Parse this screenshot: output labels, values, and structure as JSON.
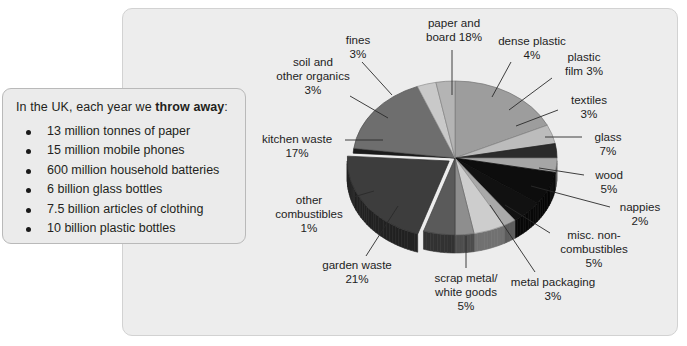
{
  "callout": {
    "heading_prefix": "In the UK, each year we ",
    "heading_bold": "throw away",
    "heading_suffix": ":",
    "items": [
      "13 million tonnes of paper",
      "15 million mobile phones",
      "600 million household batteries",
      "6 billion glass bottles",
      "7.5 billion articles of clothing",
      "10 billion plastic bottles"
    ]
  },
  "chart_data": {
    "type": "pie",
    "title": "",
    "subtitle": "",
    "xlabel": "",
    "ylabel": "",
    "legend_position": "callout-labels",
    "grid": false,
    "units": "percent",
    "total": 100,
    "categories": [
      "paper and board",
      "dense plastic",
      "plastic film",
      "textiles",
      "glass",
      "wood",
      "nappies",
      "misc. non-combustibles",
      "metal packaging",
      "scrap metal/white goods",
      "garden waste",
      "other combustibles",
      "kitchen waste",
      "soil and other organics",
      "fines"
    ],
    "values": [
      18,
      4,
      3,
      3,
      7,
      5,
      2,
      5,
      3,
      5,
      21,
      1,
      17,
      3,
      3
    ],
    "slices": [
      {
        "name": "paper and board",
        "value": 18,
        "label": "paper and\nboard 18%",
        "color": "#9d9d9d"
      },
      {
        "name": "dense plastic",
        "value": 4,
        "label": "dense plastic\n4%",
        "color": "#bcbcbc"
      },
      {
        "name": "plastic film",
        "value": 3,
        "label": "plastic\nfilm 3%",
        "color": "#2b2b2b"
      },
      {
        "name": "textiles",
        "value": 3,
        "label": "textiles\n3%",
        "color": "#a6a6a6"
      },
      {
        "name": "glass",
        "value": 7,
        "label": "glass\n7%",
        "color": "#0d0d0d"
      },
      {
        "name": "wood",
        "value": 5,
        "label": "wood\n5%",
        "color": "#111111"
      },
      {
        "name": "nappies",
        "value": 2,
        "label": "nappies\n2%",
        "color": "#a9a9a9"
      },
      {
        "name": "misc. non-combustibles",
        "value": 5,
        "label": "misc. non-\ncombustibles\n5%",
        "color": "#cdcdcd"
      },
      {
        "name": "metal packaging",
        "value": 3,
        "label": "metal packaging\n3%",
        "color": "#8e8e8e"
      },
      {
        "name": "scrap metal/white goods",
        "value": 5,
        "label": "scrap metal/\nwhite goods\n5%",
        "color": "#5a5a5a"
      },
      {
        "name": "garden waste",
        "value": 21,
        "label": "garden waste\n21%",
        "color": "#3d3d3d"
      },
      {
        "name": "other combustibles",
        "value": 1,
        "label": "other\ncombustibles\n1%",
        "color": "#1b1b1b"
      },
      {
        "name": "kitchen waste",
        "value": 17,
        "label": "kitchen waste\n17%",
        "color": "#6e6e6e"
      },
      {
        "name": "soil and other organics",
        "value": 3,
        "label": "soil and\nother organics\n3%",
        "color": "#c9c9c9"
      },
      {
        "name": "fines",
        "value": 3,
        "label": "fines\n3%",
        "color": "#b4b4b4"
      }
    ]
  },
  "labels": {
    "paper_and_board": {
      "l1": "paper and",
      "l2": "board 18%"
    },
    "fines": {
      "l1": "fines",
      "l2": "3%"
    },
    "dense_plastic": {
      "l1": "dense plastic",
      "l2": "4%"
    },
    "plastic_film": {
      "l1": "plastic",
      "l2": "film 3%"
    },
    "soil_organics": {
      "l1": "soil and",
      "l2": "other organics",
      "l3": "3%"
    },
    "textiles": {
      "l1": "textiles",
      "l2": "3%"
    },
    "glass": {
      "l1": "glass",
      "l2": "7%"
    },
    "kitchen_waste": {
      "l1": "kitchen waste",
      "l2": "17%"
    },
    "wood": {
      "l1": "wood",
      "l2": "5%"
    },
    "nappies": {
      "l1": "nappies",
      "l2": "2%"
    },
    "other_comb": {
      "l1": "other",
      "l2": "combustibles",
      "l3": "1%"
    },
    "misc_noncomb": {
      "l1": "misc. non-",
      "l2": "combustibles",
      "l3": "5%"
    },
    "garden_waste": {
      "l1": "garden waste",
      "l2": "21%"
    },
    "metal_packaging": {
      "l1": "metal packaging",
      "l2": "3%"
    },
    "scrap_metal": {
      "l1": "scrap metal/",
      "l2": "white goods",
      "l3": "5%"
    }
  },
  "theme": {
    "panel_bg": "#ededed",
    "panel_border": "#d2d2d2",
    "callout_bg": "#ebebeb",
    "callout_border": "#b9b9b9",
    "text": "#231f20",
    "leader_line": "#2a2a2a"
  }
}
